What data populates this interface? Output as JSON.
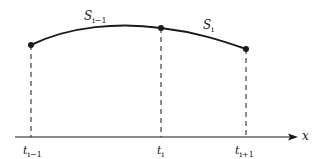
{
  "diagram": {
    "colors": {
      "ink": "#1a1a1a",
      "background": "#ffffff"
    },
    "axis": {
      "label": "x"
    },
    "curve_labels": [
      {
        "id": "s_prev",
        "base": "S",
        "sub": "i−1"
      },
      {
        "id": "s_cur",
        "base": "S",
        "sub": "i"
      }
    ],
    "knot_labels": [
      {
        "id": "t_prev",
        "base": "t",
        "sub": "i−1"
      },
      {
        "id": "t_cur",
        "base": "t",
        "sub": "i"
      },
      {
        "id": "t_next",
        "base": "t",
        "sub": "i+1"
      }
    ],
    "points": [
      {
        "name": "knot-point-prev",
        "x": 31,
        "y": 45
      },
      {
        "name": "knot-point-cur",
        "x": 161,
        "y": 28
      },
      {
        "name": "knot-point-next",
        "x": 246,
        "y": 49
      }
    ]
  }
}
